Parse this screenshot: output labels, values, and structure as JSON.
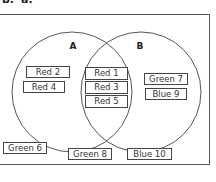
{
  "header": {
    "cut_text_1": "b.",
    "cut_text_2": "a."
  },
  "venn": {
    "sets": [
      {
        "label": "A",
        "cx": 72,
        "cy": 92,
        "r": 60
      },
      {
        "label": "B",
        "cx": 141,
        "cy": 92,
        "r": 60
      }
    ],
    "only_a": [
      "Red 2",
      "Red 4"
    ],
    "a_and_b": [
      "Red 1",
      "Red 3",
      "Red 5"
    ],
    "only_b": [
      "Green 7",
      "Blue 9"
    ],
    "outside": [
      "Green 6",
      "Green 8",
      "Blue 10"
    ]
  }
}
